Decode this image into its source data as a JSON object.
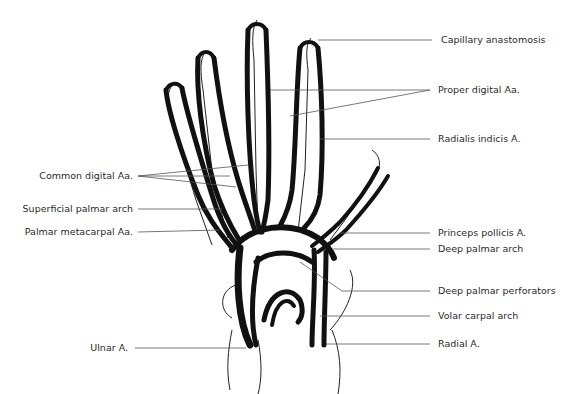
{
  "figure": {
    "labels_right": [
      {
        "id": "capillary-anastomosis",
        "text": "Capillary anastomosis",
        "x": 441,
        "y": 40
      },
      {
        "id": "proper-digital",
        "text": "Proper digital Aa.",
        "x": 438,
        "y": 90
      },
      {
        "id": "radialis-indicis",
        "text": "Radialis indicis A.",
        "x": 438,
        "y": 139
      },
      {
        "id": "princeps-pollicis",
        "text": "Princeps pollicis A.",
        "x": 438,
        "y": 233
      },
      {
        "id": "deep-palmar-arch",
        "text": "Deep palmar arch",
        "x": 438,
        "y": 249
      },
      {
        "id": "deep-palmar-perforators",
        "text": "Deep palmar perforators",
        "x": 438,
        "y": 291
      },
      {
        "id": "volar-carpal-arch",
        "text": "Volar carpal arch",
        "x": 438,
        "y": 316
      },
      {
        "id": "radial-a",
        "text": "Radial A.",
        "x": 438,
        "y": 344
      }
    ],
    "labels_left": [
      {
        "id": "common-digital",
        "text": "Common digital Aa.",
        "x": 133,
        "y": 176
      },
      {
        "id": "superficial-palmar-arch",
        "text": "Superficial palmar arch",
        "x": 133,
        "y": 209
      },
      {
        "id": "palmar-metacarpal",
        "text": "Palmar metacarpal Aa.",
        "x": 133,
        "y": 232
      },
      {
        "id": "ulnar-a",
        "text": "Ulnar A.",
        "x": 128,
        "y": 348
      }
    ]
  }
}
